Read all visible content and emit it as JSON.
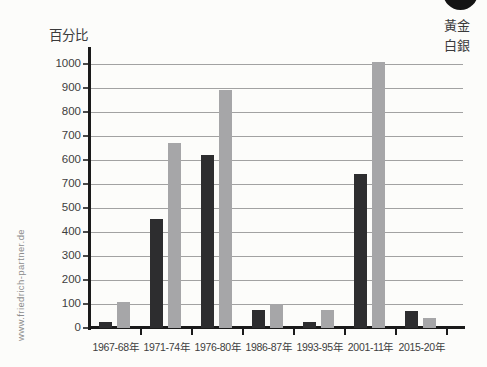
{
  "page": {
    "watermark": "www.friedrich-partner.de",
    "y_axis_title": "百分比"
  },
  "colors": {
    "gold_bar": "#2d2d2f",
    "silver_bar": "#a6a6a8",
    "axis": "#1a1a1a",
    "gridline": "#a2a2a2",
    "background": "#fcfcfa",
    "watermark_text": "#8c8c8c",
    "corner_circle": "#141414"
  },
  "chart_data": {
    "type": "bar",
    "title": "",
    "ylabel": "百分比",
    "xlabel": "",
    "grid": "horizontal",
    "legend_position": "top-right",
    "categories": [
      "1967-68年",
      "1971-74年",
      "1976-80年",
      "1986-87年",
      "1993-95年",
      "2001-11年",
      "2015-20年"
    ],
    "series": [
      {
        "name": "黃金",
        "color": "#2d2d2f",
        "values": [
          25,
          455,
          620,
          75,
          25,
          570,
          70
        ]
      },
      {
        "name": "白銀",
        "color": "#a6a6a8",
        "values": [
          110,
          670,
          890,
          100,
          75,
          1010,
          40
        ]
      }
    ],
    "y_tick_labels_top_to_bottom": [
      "1000",
      "900",
      "800",
      "700",
      "600",
      "700",
      "500",
      "400",
      "300",
      "200",
      "100",
      "0"
    ],
    "ylim_as_labeled": [
      0,
      1000
    ]
  }
}
